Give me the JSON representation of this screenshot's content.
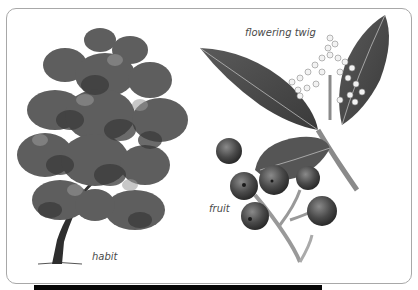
{
  "figure": {
    "panels": [
      {
        "id": "habit",
        "label": "habit",
        "subject": "tree-illustration"
      },
      {
        "id": "flowering-twig",
        "label": "flowering twig",
        "subject": "flowering-twig-illustration"
      },
      {
        "id": "fruit",
        "label": "fruit",
        "subject": "fruit-cluster-illustration"
      }
    ]
  },
  "colors": {
    "frame_border": "#a8a8a8",
    "label_text": "#4a4a4a",
    "bottom_bar": "#050505",
    "foliage_dark": "#3a3a3a",
    "foliage_mid": "#6e6e6e",
    "foliage_light": "#9a9a9a"
  }
}
